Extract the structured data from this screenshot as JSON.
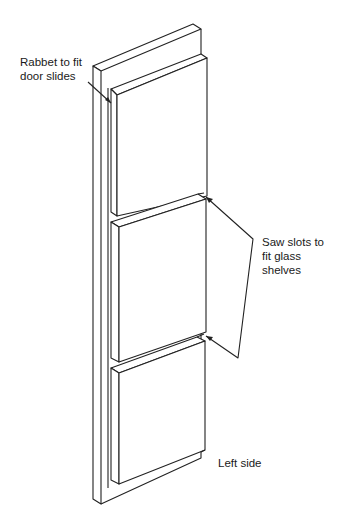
{
  "diagram": {
    "labels": {
      "rabbet": [
        "Rabbet to fit",
        "door slides"
      ],
      "slots": [
        "Saw slots to",
        "fit glass",
        "shelves"
      ],
      "side": "Left side"
    },
    "colors": {
      "line": "#222222",
      "background": "#ffffff"
    }
  }
}
